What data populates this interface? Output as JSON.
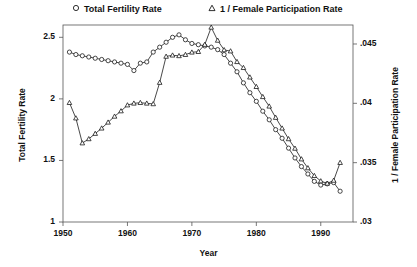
{
  "chart_data": {
    "type": "line",
    "title": "",
    "xlabel": "Year",
    "ylabel": "Total Fertility Rate",
    "ylabel_right": "1 / Female Participation Rate",
    "xlim": [
      1950,
      1995
    ],
    "ylim": [
      1,
      2.6
    ],
    "ylim_right": [
      0.03,
      0.0466
    ],
    "xticks": [
      1950,
      1960,
      1970,
      1980,
      1990
    ],
    "xtick_labels": [
      "1950",
      "1960",
      "1970",
      "1980",
      "1990"
    ],
    "yticks": [
      1,
      1.5,
      2,
      2.5
    ],
    "ytick_labels": [
      "1",
      "1.5",
      "2",
      "2.5"
    ],
    "yticks_right": [
      0.03,
      0.035,
      0.04,
      0.045
    ],
    "ytick_labels_right": [
      ".03",
      ".035",
      ".04",
      ".045"
    ],
    "grid": false,
    "legend_position": "top",
    "marker_color": "#1a1a1a",
    "line_color": "#1a1a1a",
    "background": "#ffffff",
    "x": [
      1951,
      1952,
      1953,
      1954,
      1955,
      1956,
      1957,
      1958,
      1959,
      1960,
      1961,
      1962,
      1963,
      1964,
      1965,
      1966,
      1967,
      1968,
      1969,
      1970,
      1971,
      1972,
      1973,
      1974,
      1975,
      1976,
      1977,
      1978,
      1979,
      1980,
      1981,
      1982,
      1983,
      1984,
      1985,
      1986,
      1987,
      1988,
      1989,
      1990,
      1991,
      1992,
      1993
    ],
    "series": [
      {
        "name": "Total Fertility Rate",
        "marker": "circle",
        "axis": "left",
        "values": [
          2.38,
          2.36,
          2.35,
          2.34,
          2.33,
          2.32,
          2.31,
          2.3,
          2.29,
          2.28,
          2.23,
          2.29,
          2.3,
          2.38,
          2.42,
          2.46,
          2.5,
          2.52,
          2.48,
          2.45,
          2.44,
          2.43,
          2.42,
          2.4,
          2.36,
          2.29,
          2.22,
          2.13,
          2.05,
          1.98,
          1.9,
          1.83,
          1.75,
          1.68,
          1.6,
          1.52,
          1.45,
          1.39,
          1.33,
          1.3,
          1.31,
          1.32,
          1.25
        ]
      },
      {
        "name": "1 / Female Participation Rate",
        "marker": "triangle",
        "axis": "right",
        "values": [
          0.04005,
          0.03875,
          0.03665,
          0.037,
          0.03745,
          0.0379,
          0.0384,
          0.0389,
          0.03935,
          0.03985,
          0.04,
          0.04005,
          0.04,
          0.03995,
          0.04175,
          0.04395,
          0.04405,
          0.044,
          0.0441,
          0.0443,
          0.04435,
          0.04495,
          0.0464,
          0.0453,
          0.0445,
          0.0444,
          0.0435,
          0.043,
          0.0422,
          0.0414,
          0.04055,
          0.03975,
          0.0388,
          0.0379,
          0.037,
          0.0362,
          0.0353,
          0.03455,
          0.0339,
          0.03345,
          0.03325,
          0.0335,
          0.035
        ]
      }
    ]
  },
  "legend": {
    "entries": [
      {
        "label": "Total Fertility Rate",
        "marker": "circle-marker-icon"
      },
      {
        "label": "1 / Female Participation Rate",
        "marker": "triangle-marker-icon"
      }
    ]
  },
  "axes": {
    "left_title": "Total Fertility Rate",
    "right_title": "1 / Female Participation Rate",
    "bottom_title": "Year"
  }
}
